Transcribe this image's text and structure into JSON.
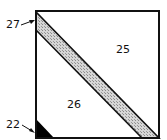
{
  "diagram": {
    "type": "patent-figure",
    "regions": [
      {
        "id": "25",
        "label": "25",
        "description": "upper-right triangular region"
      },
      {
        "id": "26",
        "label": "26",
        "description": "lower-left triangular region"
      },
      {
        "id": "27",
        "label": "27",
        "description": "hatched diagonal band"
      },
      {
        "id": "22",
        "label": "22",
        "description": "solid black corner triangle"
      }
    ],
    "colors": {
      "outline": "#111111",
      "hatch_fill": "#c8c8c8",
      "corner_fill": "#000000",
      "background": "#ffffff"
    }
  }
}
